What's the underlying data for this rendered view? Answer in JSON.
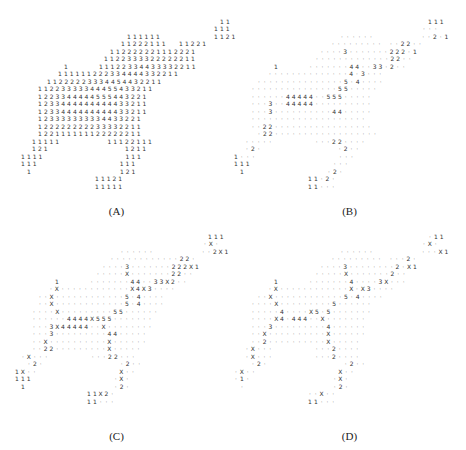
{
  "panels": [
    {
      "id": "A",
      "caption": "(A)",
      "origin": [
        0,
        0
      ],
      "caption_y": 205,
      "rows": [
        {
          "y": 22,
          "x0": 222,
          "cells": "1 1"
        },
        {
          "y": 29,
          "x0": 216,
          "cells": "1 1 1"
        },
        {
          "y": 37,
          "x0": 129,
          "cells": "1 1 1 1 1 1 _ _ _ _ _ _ _ _ _ 1 1 2 1"
        },
        {
          "y": 44,
          "x0": 123,
          "cells": "1 1 2 2 2 1 1 1 _ _ 1 1 2 2 1"
        },
        {
          "y": 52,
          "x0": 112,
          "cells": "1 1 2 2 2 2 2 2 1 1 1 2 2 2 1"
        },
        {
          "y": 59,
          "x0": 106,
          "cells": "1 1 2 2 3 3 3 3 2 2 2 2 2 2 1 1"
        },
        {
          "y": 67,
          "x0": 66,
          "cells": "1 _ _ _ _ _ 1 1 1 2 2 3 3 4 4 3 3 3 3 2 2 1 1"
        },
        {
          "y": 74,
          "x0": 60,
          "cells": "1 1 1 1 1 1 2 2 2 3 3 4 4 4 4 3 3 2 2 1 1"
        },
        {
          "y": 82,
          "x0": 49,
          "cells": "1 1 2 2 2 2 2 3 3 3 4 4 5 4 4 3 2 2 1 1"
        },
        {
          "y": 89,
          "x0": 40,
          "cells": "1 1 2 2 3 3 3 3 3 4 4 4 5 5 4 3 3 2 1 1"
        },
        {
          "y": 97,
          "x0": 40,
          "cells": "1 2 2 3 3 4 4 4 4 4 5 5 5 4 4 3 2 2 1"
        },
        {
          "y": 104,
          "x0": 40,
          "cells": "1 2 3 3 4 4 4 4 4 4 4 4 4 4 3 3 2 1 1"
        },
        {
          "y": 112,
          "x0": 40,
          "cells": "1 2 3 3 4 4 4 4 4 4 4 4 4 4 3 3 2 1 1"
        },
        {
          "y": 119,
          "x0": 40,
          "cells": "1 2 3 3 3 3 3 3 3 3 3 4 4 3 3 2 2 1"
        },
        {
          "y": 127,
          "x0": 40,
          "cells": "1 2 2 2 2 2 2 2 2 2 3 3 3 3 2 2 1 1"
        },
        {
          "y": 134,
          "x0": 40,
          "cells": "1 2 2 1 1 1 1 1 1 1 2 2 2 2 2 2 1 1"
        },
        {
          "y": 142,
          "x0": 34,
          "cells": "1 1 1 1 1 _ _ _ _ _ _ _ _ 1 1 1 2 2 1 1 1"
        },
        {
          "y": 149,
          "x0": 34,
          "cells": "1 2 1 _ _ _ _ _ _ _ _ _ _ _ _ _ 1 2 1 1"
        },
        {
          "y": 157,
          "x0": 23,
          "cells": "1 1 1 1 _ _ _ _ _ _ _ _ _ _ _ _ _ _ 1 1 1"
        },
        {
          "y": 164,
          "x0": 23,
          "cells": "1 1 1 _ _ _ _ _ _ _ _ _ _ _ _ _ _ 1 1 1"
        },
        {
          "y": 172,
          "x0": 29,
          "cells": "1 _ _ _ _ _ _ _ _ _ _ _ _ _ _ _ 1 2 1"
        },
        {
          "y": 179,
          "x0": 97,
          "cells": "1 1 1 2 1"
        },
        {
          "y": 187,
          "x0": 97,
          "cells": "1 1 1 1 1"
        }
      ]
    },
    {
      "id": "B",
      "caption": "(B)",
      "origin": [
        233,
        0
      ],
      "caption_y": 205,
      "rows": [
        {
          "y": 22,
          "x0": 197,
          "cells": "1 1 1"
        },
        {
          "y": 29,
          "x0": 191,
          "cells": "· · ·"
        },
        {
          "y": 37,
          "x0": 109,
          "cells": "· · · · · · _ _ _ _ _ _ _ _ · · 2 · 1"
        },
        {
          "y": 44,
          "x0": 100,
          "cells": "· · · · · · · · · _ · · 2 2 · ·"
        },
        {
          "y": 52,
          "x0": 89,
          "cells": "· · · · 3 · · · · · · · 2 2 2 · 1"
        },
        {
          "y": 59,
          "x0": 84,
          "cells": "· · · · · · · · · · · · · 2 2 · ·"
        },
        {
          "y": 67,
          "x0": 43,
          "cells": "1 _ _ _ _ _ · · · · · · · 4 4 · · 3 3 · 2 · ·"
        },
        {
          "y": 74,
          "x0": 37,
          "cells": "· · · · · · · · · · · · · · 4 · 3 · · ·"
        },
        {
          "y": 82,
          "x0": 26,
          "cells": "· · · · · · · · · · · · · · · 5 · 4 · · · ·"
        },
        {
          "y": 89,
          "x0": 20,
          "cells": "· · · · · · · · · · · · · · · 5 5 · · · · ·"
        },
        {
          "y": 97,
          "x0": 20,
          "cells": "· · · · · · 4 4 4 4 4 · · 5 5 5 · · · · ·"
        },
        {
          "y": 104,
          "x0": 20,
          "cells": "· · · 3 · · 4 4 4 4 4 · · · · · · · · · ·"
        },
        {
          "y": 112,
          "x0": 20,
          "cells": "· · · 3 · · · · · · · · · · 4 4 · · · · ·"
        },
        {
          "y": 119,
          "x0": 20,
          "cells": "· · · · · · · · · · · · · · · · · · · ·"
        },
        {
          "y": 127,
          "x0": 20,
          "cells": "· · 2 2 · · · · · · · · · · · · · · · · ·"
        },
        {
          "y": 134,
          "x0": 26,
          "cells": "· 2 2 · · · · · · · · · · · · · · · · · ·"
        },
        {
          "y": 142,
          "x0": 14,
          "cells": "· · · · · _ _ _ _ _ _ _ · · · 2 2 · · · ·"
        },
        {
          "y": 149,
          "x0": 14,
          "cells": "· 2 · _ _ _ _ _ _ _ _ _ _ _ _ _ · 2 · ·"
        },
        {
          "y": 157,
          "x0": 3,
          "cells": "1 · · · _ _ _ _ _ _ _ _ _ _ _ _ _ _ · · ·"
        },
        {
          "y": 164,
          "x0": 3,
          "cells": "1 1 1 _ _ _ _ _ _ _ _ _ _ _ _ _ _ · · ·"
        },
        {
          "y": 172,
          "x0": 9,
          "cells": "1 _ _ _ _ _ _ _ _ _ _ _ _ _ _ · 2 ·"
        },
        {
          "y": 179,
          "x0": 77,
          "cells": "1 1 · 2 ·"
        },
        {
          "y": 187,
          "x0": 77,
          "cells": "1 1 · · ·"
        }
      ]
    },
    {
      "id": "C",
      "caption": "(C)",
      "origin": [
        0,
        225
      ],
      "caption_y": 205,
      "rows": [
        {
          "y": 12,
          "x0": 210,
          "cells": "1 1 1"
        },
        {
          "y": 19,
          "x0": 205,
          "cells": "· X ·"
        },
        {
          "y": 27,
          "x0": 122,
          "cells": "· · · · · · _ _ _ _ _ _ _ _ · · 2 X 1"
        },
        {
          "y": 34,
          "x0": 112,
          "cells": "· · · · · · · · · · · · 2 2 ·"
        },
        {
          "y": 42,
          "x0": 104,
          "cells": "· · · · 3 · · · · · · · 2 2 2 X 1"
        },
        {
          "y": 49,
          "x0": 98,
          "cells": "· · · · · X · · · · · · · 2 2 · ·"
        },
        {
          "y": 57,
          "x0": 57,
          "cells": "1 _ _ _ _ _ · · · · · · · 4 4 · · 3 3 X 2 · ·"
        },
        {
          "y": 64,
          "x0": 51,
          "cells": "· X · · · · · · · · · · · · X 4 X 3 · · · ·"
        },
        {
          "y": 72,
          "x0": 40,
          "cells": "· · X · · · · · · · · · · · · 5 · 4 · · · ·"
        },
        {
          "y": 79,
          "x0": 40,
          "cells": "· · X · · · · · · · · · · · · 5 · 4 · · · ·"
        },
        {
          "y": 87,
          "x0": 34,
          "cells": "· · · · X · · · · · · · · · 5 5 · · · · · ·"
        },
        {
          "y": 94,
          "x0": 34,
          "cells": "· · · · · · 4 4 4 4 X 5 5 5 · · · · · · ·"
        },
        {
          "y": 102,
          "x0": 34,
          "cells": "· · · 3 X 4 4 4 4 4 · · X · · · · · · · ·"
        },
        {
          "y": 109,
          "x0": 34,
          "cells": "· · · 3 · · · · · · · · · 4 4 · · · · ·"
        },
        {
          "y": 117,
          "x0": 34,
          "cells": "· · X · · · · · · · · · · X · · · · · ·"
        },
        {
          "y": 124,
          "x0": 34,
          "cells": "· · 2 2 · · · · · · · · · X · · · · ·"
        },
        {
          "y": 132,
          "x0": 23,
          "cells": "· X · · · _ _ _ _ _ _ _ · · · 2 2 · · ·"
        },
        {
          "y": 139,
          "x0": 29,
          "cells": "· 2 · _ _ _ _ _ _ _ _ _ _ _ _ _ · 2 · ·"
        },
        {
          "y": 147,
          "x0": 17,
          "cells": "1 X · · _ _ _ _ _ _ _ _ _ _ _ _ _ _ X · ·"
        },
        {
          "y": 154,
          "x0": 17,
          "cells": "1 1 1 _ _ _ _ _ _ _ _ _ _ _ _ _ _ · X ·"
        },
        {
          "y": 162,
          "x0": 23,
          "cells": "1 _ _ _ _ _ _ _ _ _ _ _ _ _ _ _ · 2 ·"
        },
        {
          "y": 169,
          "x0": 89,
          "cells": "1 1 X 2 ·"
        },
        {
          "y": 177,
          "x0": 89,
          "cells": "1 1 · · ·"
        }
      ]
    },
    {
      "id": "D",
      "caption": "(D)",
      "origin": [
        233,
        225
      ],
      "caption_y": 205,
      "rows": [
        {
          "y": 12,
          "x0": 197,
          "cells": "· 1 1"
        },
        {
          "y": 19,
          "x0": 191,
          "cells": "· X ·"
        },
        {
          "y": 27,
          "x0": 109,
          "cells": "· · · · · · _ _ _ _ _ _ _ _ · · · X 1"
        },
        {
          "y": 34,
          "x0": 100,
          "cells": "· · · · · · · · · _ · · · 2 ·"
        },
        {
          "y": 42,
          "x0": 89,
          "cells": "· · · · 3 · · · · · · · · 2 · X 1"
        },
        {
          "y": 49,
          "x0": 84,
          "cells": "· · · · · X · · · · · · · 2 · ·"
        },
        {
          "y": 57,
          "x0": 43,
          "cells": "1 _ _ _ _ _ · · · · · · · 4 · · · · 3 X · · ·"
        },
        {
          "y": 64,
          "x0": 37,
          "cells": "· X · · · · · · · · · · · · X · X 3 · · · ·"
        },
        {
          "y": 72,
          "x0": 26,
          "cells": "· · X · · · · · · · · · · · · 5 · 4 · · · ·"
        },
        {
          "y": 79,
          "x0": 20,
          "cells": "· · · · X · · · · · · · · · 5 · · · · · ·"
        },
        {
          "y": 87,
          "x0": 20,
          "cells": "· · · · · 4 · · · · X 5 · 5 · · · · · · ·"
        },
        {
          "y": 94,
          "x0": 20,
          "cells": "· · · · X 4 · 4 4 4 · · X · · · · · · ·"
        },
        {
          "y": 102,
          "x0": 20,
          "cells": "· · · 3 · · · · · · · · · 4 · · · · · ·"
        },
        {
          "y": 109,
          "x0": 20,
          "cells": "· · X · · · · · · · · · · X · · · · · ·"
        },
        {
          "y": 117,
          "x0": 20,
          "cells": "· · 2 · · · · · · · · · · X · · · · ·"
        },
        {
          "y": 124,
          "x0": 14,
          "cells": "· X · · · _ _ _ _ _ _ _ · · · 2 · · · ·"
        },
        {
          "y": 132,
          "x0": 14,
          "cells": "· X · · · _ _ _ _ _ _ _ · · · 2 · · · ·"
        },
        {
          "y": 139,
          "x0": 20,
          "cells": "· 2 · _ _ _ _ _ _ _ _ _ _ _ _ _ · 2 · ·"
        },
        {
          "y": 147,
          "x0": 3,
          "cells": "· X · · _ _ _ _ _ _ _ _ _ _ _ _ _ _ X · ·"
        },
        {
          "y": 154,
          "x0": 3,
          "cells": "· 1 · _ _ _ _ _ _ _ _ _ _ _ _ _ _ · X ·"
        },
        {
          "y": 162,
          "x0": 9,
          "cells": "· _ _ _ _ _ _ _ _ _ _ _ _ _ _ _ · 2 ·"
        },
        {
          "y": 169,
          "x0": 77,
          "cells": "· · X · ·"
        },
        {
          "y": 177,
          "x0": 77,
          "cells": "1 1 · · ·"
        }
      ]
    }
  ],
  "grid": {
    "dx": 5.8,
    "blank_token": "_",
    "dot_token": "·"
  }
}
